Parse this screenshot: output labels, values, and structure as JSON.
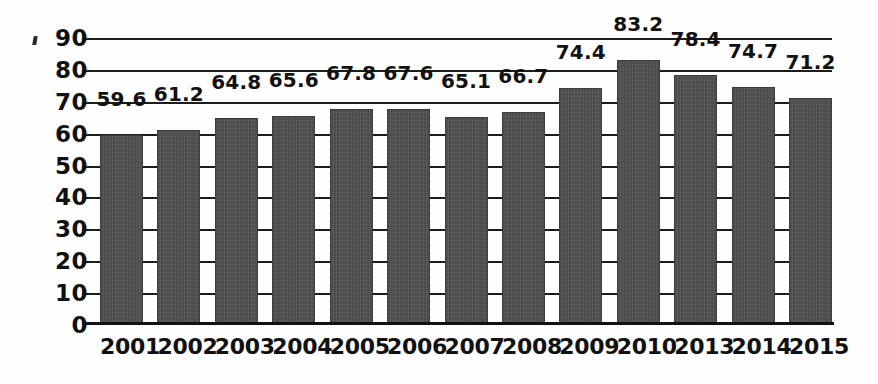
{
  "chart_data": {
    "type": "bar",
    "title": "",
    "subtitle": "",
    "xlabel": "",
    "ylabel": "",
    "categories": [
      "2001",
      "2002",
      "2003",
      "2004",
      "2005",
      "2006",
      "2007",
      "2008",
      "2009",
      "2010",
      "2013",
      "2014",
      "2015"
    ],
    "values": [
      59.6,
      61.2,
      64.8,
      65.6,
      67.8,
      67.6,
      65.1,
      66.7,
      74.4,
      83.2,
      78.4,
      74.7,
      71.2
    ],
    "value_labels": [
      "59.6",
      "61.2",
      "64.8",
      "65.6",
      "67.8",
      "67.6",
      "65.1",
      "66.7",
      "74.4",
      "83.2",
      "78.4",
      "74.7",
      "71.2"
    ],
    "ylim": [
      0,
      90
    ],
    "ytick_values": [
      0,
      10,
      20,
      30,
      40,
      50,
      60,
      70,
      80,
      90
    ],
    "ytick_labels": [
      "0",
      "10",
      "20",
      "30",
      "40",
      "50",
      "60",
      "70",
      "80",
      "90"
    ],
    "ytick_step": 10,
    "grid": true,
    "grid_axis": "y",
    "legend": false,
    "legend_position": "none",
    "bar_color": "#4d4d4d",
    "axis_color": "#111111",
    "grid_color": "#1c1c1c",
    "background_color": "#fefefe",
    "data_labels_shown": true,
    "missing_categories": [
      "2011",
      "2012"
    ]
  },
  "artifacts": {
    "top_left_mark": "'"
  }
}
